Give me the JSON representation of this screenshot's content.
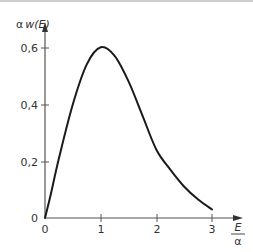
{
  "chart_data": {
    "type": "line",
    "title": "",
    "xlabel": "E/α",
    "ylabel": "α w(E)",
    "x_ticks": [
      "0",
      "1",
      "2",
      "3"
    ],
    "y_ticks": [
      "0",
      "0,2",
      "0,4",
      "0,6"
    ],
    "xlim": [
      0,
      3.5
    ],
    "ylim": [
      0,
      0.65
    ],
    "grid": false,
    "legend": null,
    "series": [
      {
        "name": "α w(E)",
        "x": [
          0,
          0.1,
          0.25,
          0.5,
          0.75,
          1.0,
          1.25,
          1.5,
          1.75,
          2.0,
          2.25,
          2.5,
          2.75,
          3.0
        ],
        "y": [
          0,
          0.08,
          0.21,
          0.4,
          0.54,
          0.6,
          0.57,
          0.48,
          0.36,
          0.24,
          0.17,
          0.11,
          0.065,
          0.03
        ]
      }
    ]
  },
  "labels": {
    "y_axis_title_prefix": "α",
    "y_axis_title_main": "w(E)",
    "x_axis_title_num": "E",
    "x_axis_title_den": "α",
    "y_tick_0": "0",
    "y_tick_02": "0,2",
    "y_tick_04": "0,4",
    "y_tick_06": "0,6",
    "x_tick_0": "0",
    "x_tick_1": "1",
    "x_tick_2": "2",
    "x_tick_3": "3"
  }
}
